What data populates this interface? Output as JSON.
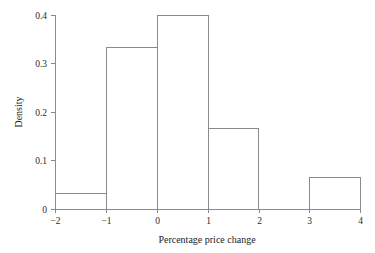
{
  "chart_data": {
    "type": "bar",
    "title": "",
    "subtitle": "",
    "xlabel": "Percentage price change",
    "ylabel": "Density",
    "xlim": [
      -2,
      4
    ],
    "ylim": [
      0,
      0.4
    ],
    "grid": false,
    "legend": false,
    "bin_edges": [
      -2,
      -1,
      0,
      1,
      2,
      3,
      4
    ],
    "categories": [
      "-2 to -1",
      "-1 to 0",
      "0 to 1",
      "1 to 2",
      "2 to 3",
      "3 to 4"
    ],
    "values": [
      0.033,
      0.333,
      0.4,
      0.167,
      0,
      0.065
    ],
    "xticks": [
      "−2",
      "−1",
      "0",
      "1",
      "2",
      "3",
      "4"
    ],
    "xtick_values": [
      -2,
      -1,
      0,
      1,
      2,
      3,
      4
    ],
    "yticks": [
      "0",
      "0.1",
      "0.2",
      "0.3",
      "0.4"
    ],
    "ytick_values": [
      0,
      0.1,
      0.2,
      0.3,
      0.4
    ],
    "bar_style": "outline",
    "colors": {
      "background": "#ffffff",
      "line": "#8a8a8a",
      "text": "#1a1a1a",
      "bar_fill": "none",
      "bar_stroke": "#8a8a8a"
    }
  }
}
